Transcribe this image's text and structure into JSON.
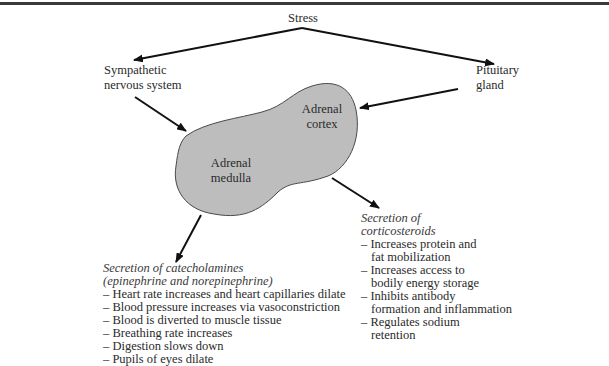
{
  "diagram": {
    "title_node": "Stress",
    "nodes": {
      "sympathetic": {
        "line1": "Sympathetic",
        "line2": "nervous system"
      },
      "pituitary": {
        "line1": "Pituitary",
        "line2": "gland"
      },
      "adrenal_cortex": {
        "line1": "Adrenal",
        "line2": "cortex"
      },
      "adrenal_medulla": {
        "line1": "Adrenal",
        "line2": "medulla"
      }
    },
    "corticosteroids": {
      "heading_line1": "Secretion of",
      "heading_line2": "corticosteroids",
      "items": [
        {
          "line1": "Increases protein and",
          "line2": "fat mobilization"
        },
        {
          "line1": "Increases access to",
          "line2": "bodily energy storage"
        },
        {
          "line1": "Inhibits antibody",
          "line2": "formation and inflammation"
        },
        {
          "line1": "Regulates sodium",
          "line2": "retention"
        }
      ]
    },
    "catecholamines": {
      "heading_line1": "Secretion of catecholamines",
      "heading_line2": "(epinephrine and norepinephrine)",
      "items": [
        "Heart rate increases and heart capillaries dilate",
        "Blood pressure increases via vasoconstriction",
        "Blood is diverted to muscle tissue",
        "Breathing rate increases",
        "Digestion slows down",
        "Pupils of eyes dilate"
      ]
    },
    "colors": {
      "gland_fill": "#bdbdbd",
      "gland_stroke": "#4a4a4a",
      "arrow": "#111111",
      "rule": "#3a3a3a"
    }
  }
}
